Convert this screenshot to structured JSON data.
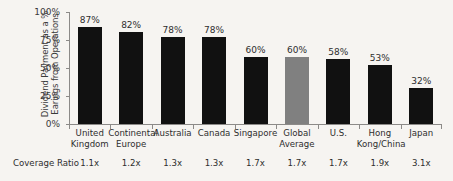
{
  "chart_data": {
    "type": "bar",
    "title": "",
    "xlabel": "",
    "ylabel": "Dividend Payment as a % Earings from Operations",
    "ylim": [
      0,
      100
    ],
    "grid": false,
    "legend": "none",
    "y_tick_labels": [
      "100%",
      "75%",
      "50%",
      "25%",
      "0%"
    ],
    "y_tick_values": [
      100,
      75,
      50,
      25,
      0
    ],
    "categories": [
      "United Kingdom",
      "Continental Europe",
      "Australia",
      "Canada",
      "Singapore",
      "Global Average",
      "U.S.",
      "Hong Kong/China",
      "Japan"
    ],
    "values": [
      87,
      82,
      78,
      78,
      60,
      60,
      58,
      53,
      32
    ],
    "value_labels": [
      "87%",
      "82%",
      "78%",
      "78%",
      "60%",
      "60%",
      "58%",
      "53%",
      "32%"
    ],
    "bar_colors": [
      "#111111",
      "#111111",
      "#111111",
      "#111111",
      "#111111",
      "#808080",
      "#111111",
      "#111111",
      "#111111"
    ],
    "highlight_category": "Global Average",
    "secondary_axis": {
      "label": "Coverage Ratio",
      "values": [
        "1.1x",
        "1.2x",
        "1.3x",
        "1.3x",
        "1.7x",
        "1.7x",
        "1.7x",
        "1.9x",
        "3.1x"
      ]
    }
  },
  "colors": {
    "background": "#f6f4f1",
    "bar_default": "#111111",
    "bar_highlight": "#808080",
    "axis": "#8c8a88",
    "text": "#2e2e2e"
  }
}
